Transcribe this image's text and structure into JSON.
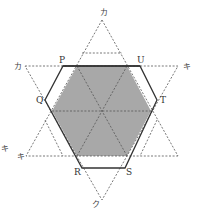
{
  "diagram": {
    "type": "geometry-hexagon-star",
    "colors": {
      "shade": "#a8a8a8",
      "line": "#333333",
      "dash": "#555555"
    },
    "vertex_labels": {
      "P": "P",
      "Q": "Q",
      "R": "R",
      "S": "S",
      "T": "T",
      "U": "U"
    },
    "star_labels": {
      "top": "カ",
      "left_top": "カ",
      "right_top": "キ",
      "left_bottom": "キ",
      "left_outer": "キ",
      "bottom": "ク"
    }
  }
}
